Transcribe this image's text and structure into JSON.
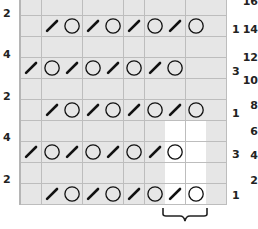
{
  "chart": {
    "columns": 10,
    "rows_visible": 10,
    "colors": {
      "cell_gray": "#e6e6e6",
      "cell_white": "#ffffff",
      "grid_line": "#bdbdbd",
      "symbol": "#111111"
    },
    "legend_symbols": {
      "/": "slash-decrease",
      "O": "yarn-over",
      "": "empty"
    },
    "rows": [
      {
        "cells": [
          "",
          "",
          "",
          "",
          "",
          "",
          "",
          "",
          "",
          ""
        ],
        "white": []
      },
      {
        "cells": [
          "",
          "/",
          "O",
          "/",
          "O",
          "/",
          "O",
          "/",
          "O",
          ""
        ],
        "white": []
      },
      {
        "cells": [
          "",
          "",
          "",
          "",
          "",
          "",
          "",
          "",
          "",
          ""
        ],
        "white": []
      },
      {
        "cells": [
          "/",
          "O",
          "/",
          "O",
          "/",
          "O",
          "/",
          "O",
          "",
          ""
        ],
        "white": []
      },
      {
        "cells": [
          "",
          "",
          "",
          "",
          "",
          "",
          "",
          "",
          "",
          ""
        ],
        "white": []
      },
      {
        "cells": [
          "",
          "/",
          "O",
          "/",
          "O",
          "/",
          "O",
          "/",
          "O",
          ""
        ],
        "white": []
      },
      {
        "cells": [
          "",
          "",
          "",
          "",
          "",
          "",
          "",
          "",
          "",
          ""
        ],
        "white": [
          7,
          8
        ]
      },
      {
        "cells": [
          "/",
          "O",
          "/",
          "O",
          "/",
          "O",
          "/",
          "O",
          "",
          ""
        ],
        "white": [
          7,
          8
        ]
      },
      {
        "cells": [
          "",
          "",
          "",
          "",
          "",
          "",
          "",
          "",
          "",
          ""
        ],
        "white": [
          7,
          8
        ]
      },
      {
        "cells": [
          "",
          "/",
          "O",
          "/",
          "O",
          "/",
          "O",
          "/",
          "O",
          ""
        ],
        "white": [
          7,
          8
        ]
      }
    ],
    "left_labels": [
      {
        "text": "2",
        "y": 8
      },
      {
        "text": "4",
        "y": 49
      },
      {
        "text": "2",
        "y": 91
      },
      {
        "text": "4",
        "y": 132
      },
      {
        "text": "2",
        "y": 174
      }
    ],
    "right_inner_labels": [
      {
        "text": "1",
        "y": 24
      },
      {
        "text": "3",
        "y": 66
      },
      {
        "text": "1",
        "y": 108
      },
      {
        "text": "3",
        "y": 149
      },
      {
        "text": "1",
        "y": 190
      }
    ],
    "right_outer_labels": [
      {
        "text": "16",
        "y": -4
      },
      {
        "text": "14",
        "y": 24
      },
      {
        "text": "12",
        "y": 52
      },
      {
        "text": "10",
        "y": 75
      },
      {
        "text": "8",
        "y": 100
      },
      {
        "text": "6",
        "y": 126
      },
      {
        "text": "4",
        "y": 150
      },
      {
        "text": "2",
        "y": 175
      }
    ],
    "brace": {
      "under_columns": [
        7,
        8
      ]
    }
  }
}
